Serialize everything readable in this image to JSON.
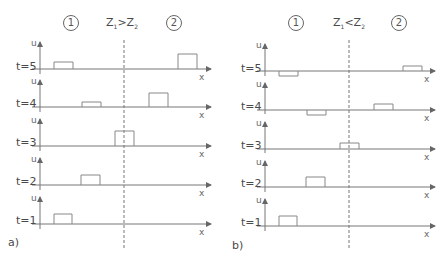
{
  "panels": [
    {
      "id": "a",
      "label": "a)",
      "medium_left": "1",
      "medium_right": "2",
      "condition": {
        "left": "Z",
        "left_sub": "1",
        "op": ">",
        "right": "Z",
        "right_sub": "2"
      },
      "rows": [
        {
          "t_label": "t=5",
          "u_label": "u",
          "x_label": "x"
        },
        {
          "t_label": "t=4",
          "u_label": "u",
          "x_label": "x"
        },
        {
          "t_label": "t=3",
          "u_label": "u",
          "x_label": "x"
        },
        {
          "t_label": "t=2",
          "u_label": "u",
          "x_label": "x"
        },
        {
          "t_label": "t=1",
          "u_label": "u",
          "x_label": "x"
        }
      ]
    },
    {
      "id": "b",
      "label": "b)",
      "medium_left": "1",
      "medium_right": "2",
      "condition": {
        "left": "Z",
        "left_sub": "1",
        "op": "<",
        "right": "Z",
        "right_sub": "2"
      },
      "rows": [
        {
          "t_label": "t=5",
          "u_label": "u",
          "x_label": "x"
        },
        {
          "t_label": "t=4",
          "u_label": "u",
          "x_label": "x"
        },
        {
          "t_label": "t=3",
          "u_label": "u",
          "x_label": "x"
        },
        {
          "t_label": "t=2",
          "u_label": "u",
          "x_label": "x"
        },
        {
          "t_label": "t=1",
          "u_label": "u",
          "x_label": "x"
        }
      ]
    }
  ]
}
